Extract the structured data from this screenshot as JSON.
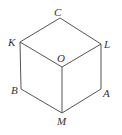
{
  "figure": {
    "type": "cube-projection",
    "background": "#ffffff",
    "stroke_color": "#555555",
    "label_color": "#333333",
    "vertices": {
      "C": {
        "label": "C",
        "x": 60,
        "y": 18
      },
      "K": {
        "label": "K",
        "x": 20,
        "y": 42
      },
      "L": {
        "label": "L",
        "x": 101,
        "y": 44
      },
      "O": {
        "label": "O",
        "x": 62,
        "y": 67
      },
      "B": {
        "label": "B",
        "x": 21,
        "y": 89
      },
      "A": {
        "label": "A",
        "x": 101,
        "y": 89
      },
      "M": {
        "label": "M",
        "x": 62,
        "y": 113
      }
    },
    "edges": [
      [
        "C",
        "K"
      ],
      [
        "C",
        "L"
      ],
      [
        "K",
        "O"
      ],
      [
        "L",
        "O"
      ],
      [
        "O",
        "M"
      ],
      [
        "K",
        "B"
      ],
      [
        "L",
        "A"
      ],
      [
        "B",
        "M"
      ],
      [
        "A",
        "M"
      ]
    ]
  }
}
